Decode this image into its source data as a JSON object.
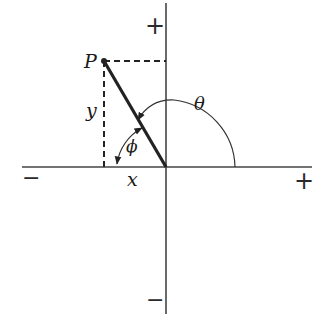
{
  "diagram": {
    "type": "polar-coordinates",
    "labels": {
      "point": "P",
      "y_component": "y",
      "x_component": "x",
      "theta": "θ",
      "phi": "ϕ"
    },
    "axis_signs": {
      "x_negative": "−",
      "x_positive": "+",
      "y_positive": "+",
      "y_negative": "−"
    },
    "colors": {
      "stroke": "#333333",
      "vector": "#222222",
      "background": "#ffffff"
    }
  }
}
